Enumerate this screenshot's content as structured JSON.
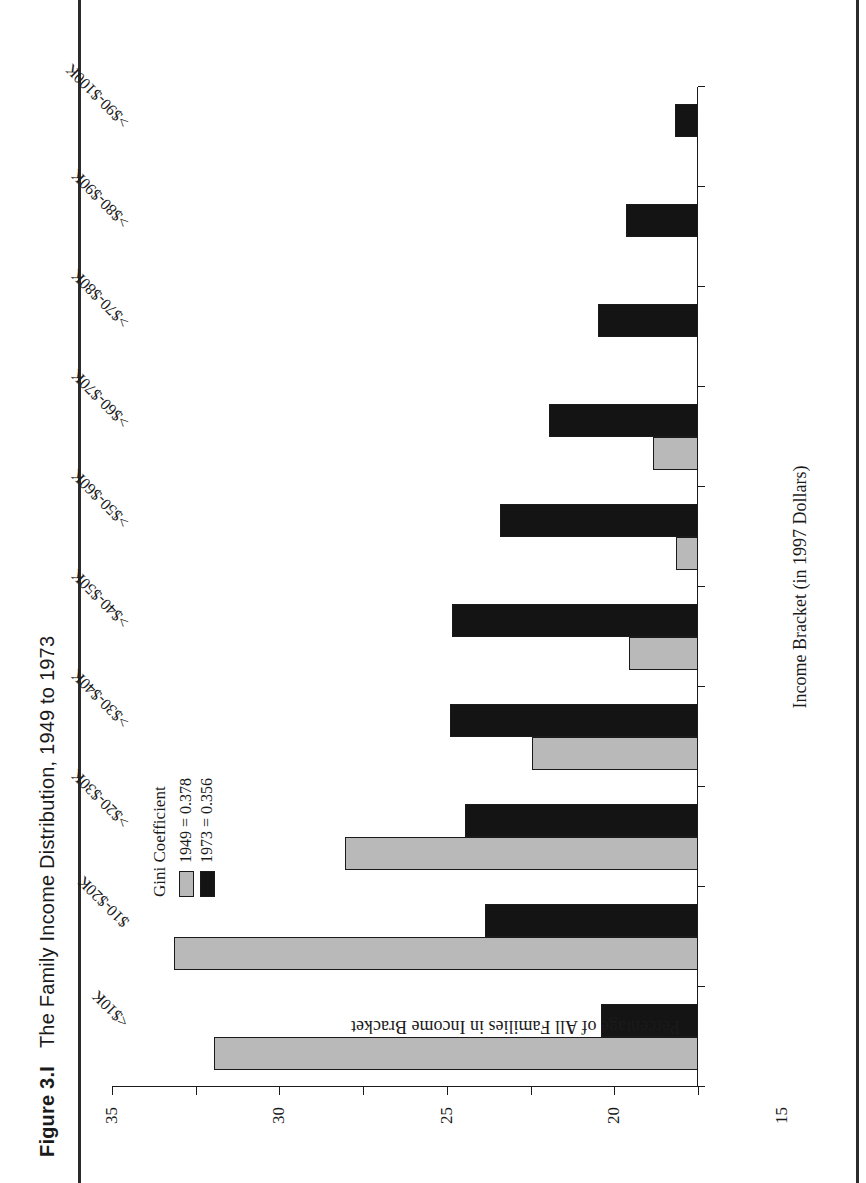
{
  "figure": {
    "number": "Figure 3.I",
    "title": "The Family Income Distribution, 1949 to 1973"
  },
  "legend": {
    "title": "Gini Coefficient",
    "entries": [
      {
        "label": "1949 = 0.378",
        "color": "#b9b9b9"
      },
      {
        "label": "1973 = 0.356",
        "color": "#141414"
      }
    ]
  },
  "chart_data": {
    "type": "bar",
    "title": "The Family Income Distribution, 1949 to 1973",
    "xlabel": "Income Bracket (in 1997 Dollars)",
    "ylabel": "Percentage of All Families in Income Bracket",
    "ylim": [
      0,
      35
    ],
    "yticks": [
      0,
      5,
      10,
      15,
      20,
      25,
      30,
      35
    ],
    "ytick_labels": [
      "0",
      "5",
      "10",
      "15",
      "20",
      "25",
      "30",
      "35"
    ],
    "grid": false,
    "legend_position": "upper-right",
    "categories": [
      "<$10K",
      "$10-$20K",
      ">$20-$30K",
      ">$30-$40K",
      ">$40-$50K",
      ">$50-$60K",
      ">$60-$70K",
      ">$70-$80K",
      ">$80-$90K",
      ">$90-$100K"
    ],
    "series": [
      {
        "name": "1949 = 0.378",
        "color": "#b9b9b9",
        "values": [
          28.9,
          31.3,
          21.1,
          9.9,
          4.1,
          1.3,
          2.7,
          0,
          0,
          0
        ]
      },
      {
        "name": "1973 = 0.356",
        "color": "#141414",
        "values": [
          5.8,
          12.7,
          13.9,
          14.8,
          14.7,
          11.8,
          8.9,
          6.0,
          4.3,
          1.4
        ]
      }
    ]
  }
}
